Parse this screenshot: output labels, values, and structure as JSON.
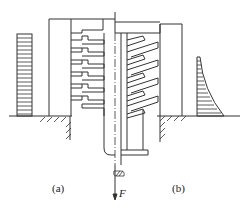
{
  "figure": {
    "subfigures": [
      {
        "id": "a",
        "label": "(a)",
        "description": "uniform load distribution across thread turns"
      },
      {
        "id": "b",
        "label": "(b)",
        "description": "non-uniform load distribution across thread turns"
      }
    ],
    "force_label": "F",
    "colors": {
      "line": "#333333",
      "background": "#ffffff"
    }
  }
}
